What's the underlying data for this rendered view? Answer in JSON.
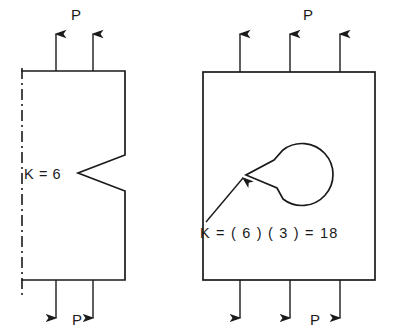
{
  "figure": {
    "background_color": "#ffffff",
    "line_color": "#1a1a1a",
    "width": 396,
    "height": 336
  },
  "left_panel": {
    "name": "edge-notch-specimen",
    "description": "Half specimen with symmetry centerline on left edge and a V-notch cut into the right edge",
    "k_label": "K = 6",
    "load_label_top": "P",
    "load_label_bottom": "P",
    "top_arrow_count": 2,
    "bottom_arrow_count": 2,
    "plate": {
      "x": 22,
      "y": 71,
      "width": 103,
      "height": 209
    },
    "notch": {
      "apex_x": 78,
      "apex_y": 173,
      "top_y": 155,
      "bottom_y": 191
    },
    "top_arrows_x": [
      56,
      93
    ],
    "bottom_arrows_x": [
      56,
      93
    ],
    "k_label_x": 24,
    "k_label_y": 179,
    "p_top_x": 71,
    "p_top_y": 20,
    "p_bottom_x": 72,
    "p_bottom_y": 325
  },
  "right_panel": {
    "name": "hole-with-crack-specimen",
    "description": "Full plate containing a circular hole with a sharp crack emanating to the left, annotated by a leader arrow",
    "k_label": "K = ( 6 ) ( 3 ) = 18",
    "load_label_top": "P",
    "load_label_bottom": "P",
    "top_arrow_count": 3,
    "bottom_arrow_count": 3,
    "plate": {
      "x": 203,
      "y": 72,
      "width": 172,
      "height": 208
    },
    "hole": {
      "cx": 306,
      "cy": 174,
      "r": 31
    },
    "crack_tip": {
      "x": 246,
      "y": 175
    },
    "top_arrows_x": [
      240,
      290,
      340
    ],
    "bottom_arrows_x": [
      240,
      290,
      340
    ],
    "k_label_x": 200,
    "k_label_y": 238,
    "p_top_x": 303,
    "p_top_y": 20,
    "p_bottom_x": 310,
    "p_bottom_y": 325,
    "leader": {
      "from_x": 206,
      "from_y": 222,
      "to_x": 243,
      "to_y": 178
    }
  },
  "annotations": {
    "k_values": {
      "notch_only": 6,
      "hole_multiplier": 3,
      "combined": 18
    }
  }
}
